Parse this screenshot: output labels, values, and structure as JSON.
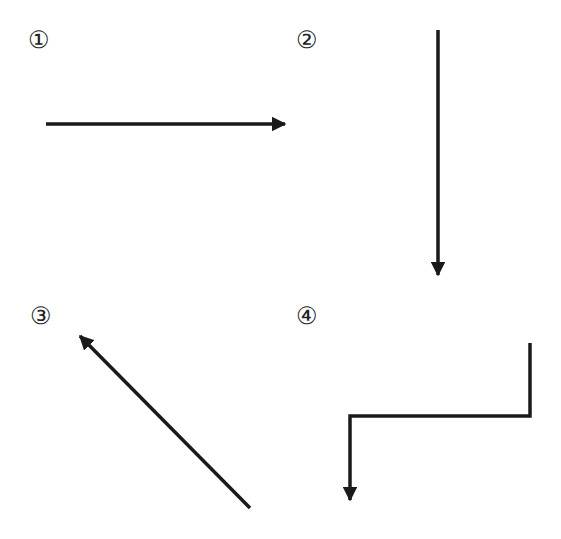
{
  "figure": {
    "panels": [
      {
        "label": "①",
        "description": "straight arrow pointing right"
      },
      {
        "label": "②",
        "description": "straight arrow pointing down"
      },
      {
        "label": "③",
        "description": "diagonal arrow pointing up-left"
      },
      {
        "label": "④",
        "description": "bent arrow: up segment, left segment, then down arrowhead"
      }
    ],
    "stroke_color": "#1a1a1a"
  }
}
